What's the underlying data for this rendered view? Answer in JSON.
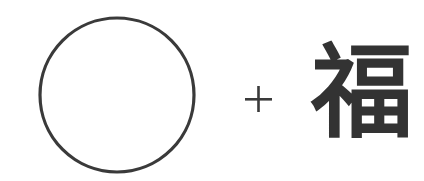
{
  "diagram": {
    "elements": [
      {
        "kind": "shape",
        "shape": "circle",
        "fill": "none",
        "stroke_color": "#3a3a3a"
      },
      {
        "kind": "operator",
        "symbol": "+",
        "color": "#3a3a3a"
      },
      {
        "kind": "character",
        "text": "福",
        "color": "#333333"
      }
    ],
    "expression": "circle + 福",
    "background_color": "#ffffff"
  }
}
